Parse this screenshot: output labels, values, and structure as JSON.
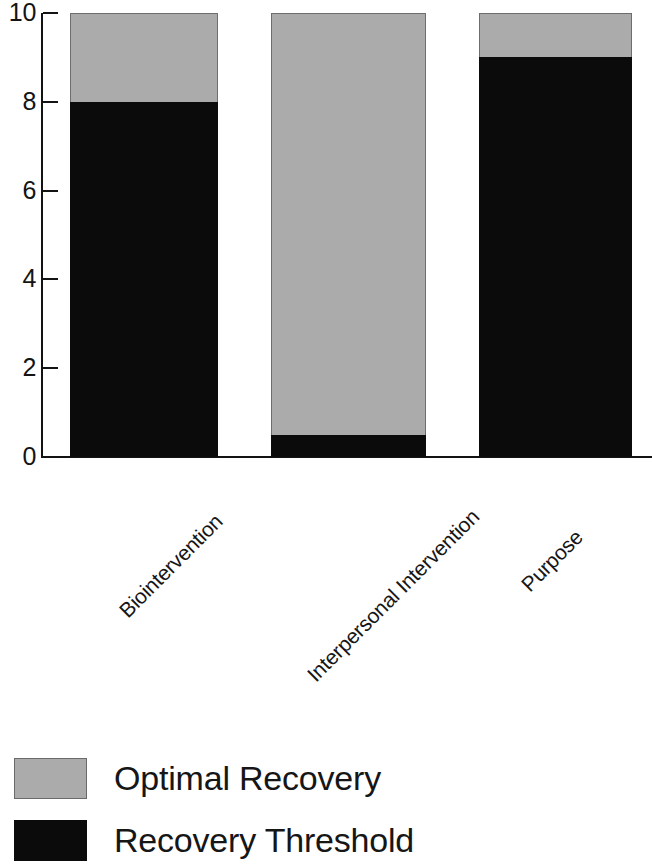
{
  "chart_data": {
    "type": "bar",
    "subtype": "stacked-bar",
    "title": "",
    "xlabel": "",
    "ylabel": "",
    "ylim": [
      0,
      10
    ],
    "yticks": [
      0,
      2,
      4,
      6,
      8,
      10
    ],
    "ytick_labels": [
      "0",
      "2",
      "4",
      "6",
      "8",
      "10"
    ],
    "grid": false,
    "legend_position": "bottom-left",
    "categories": [
      "Biointervention",
      "Interpersonal Intervention",
      "Purpose"
    ],
    "series": [
      {
        "name": "Recovery Threshold",
        "color": "#0b0b0b",
        "values": [
          8,
          0.5,
          9
        ]
      },
      {
        "name": "Optimal Recovery",
        "color": "#ababab",
        "values": [
          2,
          9.5,
          1
        ]
      }
    ],
    "stack_totals": [
      10,
      10,
      10
    ]
  },
  "axis": {
    "y": {
      "ticks": [
        {
          "label": "10",
          "value": 10
        },
        {
          "label": "8",
          "value": 8
        },
        {
          "label": "6",
          "value": 6
        },
        {
          "label": "4",
          "value": 4
        },
        {
          "label": "2",
          "value": 2
        },
        {
          "label": "0",
          "value": 0
        }
      ]
    }
  },
  "legend": {
    "items": [
      {
        "label": "Optimal Recovery",
        "swatch": "gray"
      },
      {
        "label": "Recovery Threshold",
        "swatch": "black"
      }
    ]
  },
  "colors": {
    "optimal_recovery": "#ababab",
    "recovery_threshold": "#0b0b0b",
    "axis": "#131313",
    "background": "#ffffff"
  }
}
